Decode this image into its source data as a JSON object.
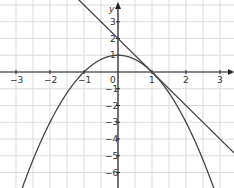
{
  "chart_data": {
    "type": "line",
    "title": "",
    "xlabel": "x",
    "ylabel": "y",
    "xlim": [
      -3.47,
      3.41
    ],
    "ylim": [
      -6.95,
      4.3
    ],
    "grid": true,
    "x_ticks": [
      -3,
      -2,
      -1,
      1,
      2,
      3
    ],
    "y_ticks": [
      3,
      2,
      1,
      -1,
      -2,
      -3,
      -4,
      -5,
      -6
    ],
    "origin_label": "0",
    "series": [
      {
        "name": "parabola",
        "equation": "y = 1 - x^2",
        "vertex": [
          0,
          1
        ],
        "roots": [
          -1,
          1
        ],
        "color": "#444444"
      },
      {
        "name": "tangent line",
        "equation": "y = 2 - 2x",
        "points": [
          [
            0,
            2
          ],
          [
            1,
            0
          ]
        ],
        "color": "#444444"
      }
    ],
    "tangent_point": [
      1,
      0
    ]
  },
  "style": {
    "grid_color": "#d9d9d9",
    "axis_color": "#222222",
    "curve_color": "#444444"
  }
}
